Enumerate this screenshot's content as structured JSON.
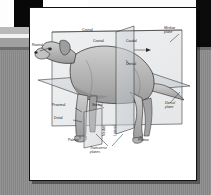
{
  "figure": {
    "topic": "Anatomical directional terms and planes of the body",
    "frame": {
      "card_background": "#ffffff",
      "card_border": "#111111",
      "page_background": "#8d8d8d",
      "accent_black": "#0b0b0b",
      "band_grey_light": "#b9b9b9",
      "band_grey_mid": "#a0a0a0",
      "plane_fill": "#c9cdd1",
      "animal_fill": "#b4b4b4",
      "line_color": "#2a2a2a"
    },
    "labels": [
      {
        "id": "cranial-top",
        "text": "Cranial",
        "x": 52,
        "y": 24,
        "rotate": false
      },
      {
        "id": "rostral",
        "text": "Rostral",
        "x": 5,
        "y": 39,
        "rotate": false
      },
      {
        "id": "cranial-plane",
        "text": "Cranial",
        "x": 64,
        "y": 36,
        "rotate": false
      },
      {
        "id": "caudal-plane",
        "text": "Caudal",
        "x": 96,
        "y": 36,
        "rotate": false
      },
      {
        "id": "dorsal-back",
        "text": "Dorsal",
        "x": 96,
        "y": 59,
        "rotate": false
      },
      {
        "id": "median-plane",
        "text": "Median\nplane",
        "x": 135,
        "y": 22,
        "rotate": false
      },
      {
        "id": "dorsal-plane",
        "text": "Dorsal\nplane",
        "x": 136,
        "y": 97,
        "rotate": false
      },
      {
        "id": "proximal",
        "text": "Proximal",
        "x": 28,
        "y": 98,
        "rotate": false
      },
      {
        "id": "ventral",
        "text": "Ventral",
        "x": 63,
        "y": 99,
        "rotate": false
      },
      {
        "id": "distal",
        "text": "Distal",
        "x": 27,
        "y": 110,
        "rotate": false
      },
      {
        "id": "palmar",
        "text": "Palmar",
        "x": 40,
        "y": 133,
        "rotate": false
      },
      {
        "id": "plantar",
        "text": "Plantar",
        "x": 110,
        "y": 133,
        "rotate": false
      },
      {
        "id": "transverse-planes",
        "text": "Transverse\nplanes",
        "x": 62,
        "y": 139,
        "rotate": false
      },
      {
        "id": "medial",
        "text": "Medial",
        "x": 74,
        "y": 126,
        "rotate": true
      },
      {
        "id": "lateral",
        "text": "Lateral",
        "x": 85,
        "y": 126,
        "rotate": true
      }
    ]
  }
}
